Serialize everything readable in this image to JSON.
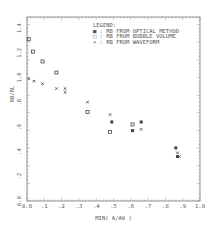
{
  "chart_data": {
    "type": "scatter",
    "title": "",
    "xlabel": "MIN( A/A0 )",
    "ylabel": "RB/RL",
    "xlim": [
      0.0,
      1.0
    ],
    "ylim": [
      0.0,
      1.48
    ],
    "xticks": [
      "0.0",
      ".1",
      ".2",
      ".3",
      ".4",
      ".5",
      ".6",
      ".7",
      ".8",
      ".9",
      "1.0"
    ],
    "yticks": [
      "0.0",
      ".2",
      ".4",
      ".6",
      ".8",
      "1.0",
      "1.2",
      "1.4"
    ],
    "grid": false,
    "legend_position": "upper right",
    "legend_title": "LEGEND:",
    "series": [
      {
        "name": "RB FROM OPTICAL METHOD",
        "marker": "filled-square",
        "x": [
          0.49,
          0.61,
          0.66,
          0.86,
          0.87
        ],
        "y": [
          0.64,
          0.57,
          0.64,
          0.43,
          0.36
        ]
      },
      {
        "name": "RB FROM BUBBLE VOLUME",
        "marker": "open-square",
        "x": [
          0.01,
          0.035,
          0.09,
          0.17,
          0.35,
          0.48,
          0.61
        ],
        "y": [
          1.31,
          1.21,
          1.13,
          1.04,
          0.72,
          0.56,
          0.62
        ]
      },
      {
        "name": "RB FROM WAVEFORM",
        "marker": "x",
        "x": [
          0.01,
          0.04,
          0.09,
          0.17,
          0.22,
          0.22,
          0.35,
          0.48,
          0.66,
          0.87,
          0.88
        ],
        "y": [
          0.99,
          0.97,
          0.95,
          0.91,
          0.91,
          0.88,
          0.8,
          0.7,
          0.58,
          0.39,
          0.36
        ]
      }
    ]
  },
  "legend": {
    "title": "LEGEND:",
    "items": [
      {
        "symbol": "■ :",
        "label": "RB FROM OPTICAL METHOD"
      },
      {
        "symbol": "□ :",
        "label": "RB FROM BUBBLE VOLUME"
      },
      {
        "symbol": "× :",
        "label": "RB FROM WAVEFORM"
      }
    ]
  },
  "axes": {
    "xlabel": "MIN( A/A0 )",
    "ylabel": "RB/RL"
  }
}
